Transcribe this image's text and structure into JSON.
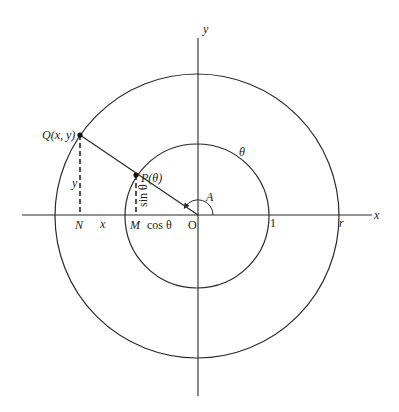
{
  "diagram": {
    "type": "unit-circle-trigonometry",
    "colors": {
      "ink": "#2a2a2a",
      "background": "#ffffff"
    },
    "center": {
      "x": 197,
      "y": 216
    },
    "inner_circle_radius": 72,
    "outer_circle_radius": 142,
    "labels": {
      "x_axis": "x",
      "y_axis": "y",
      "origin": "O",
      "angle": "A",
      "theta_on_arc": "θ",
      "point_P": "P(θ)",
      "point_Q": "Q(x, y)",
      "foot_N": "N",
      "foot_M": "M",
      "segment_x": "x",
      "segment_y": "y",
      "cos": "cos θ",
      "sin": "sin θ",
      "unit_tick": "1",
      "radius_tick": "r"
    }
  }
}
